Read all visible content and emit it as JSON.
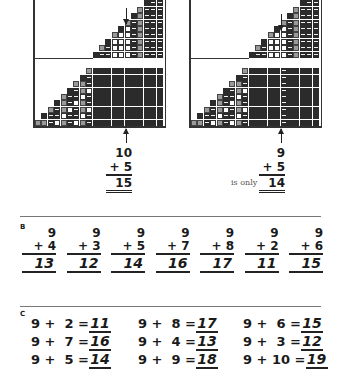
{
  "section_a": {
    "left_example": {
      "top": "10",
      "addend": "+ 5",
      "answer": "15"
    },
    "right_example": {
      "top": "9",
      "addend": "+ 5",
      "note": "is only",
      "answer": "14"
    }
  },
  "section_b": {
    "label": "B",
    "problems": [
      {
        "top": "9",
        "addend": "+ 4",
        "answer": "13"
      },
      {
        "top": "9",
        "addend": "+ 3",
        "answer": "12"
      },
      {
        "top": "9",
        "addend": "+ 5",
        "answer": "14"
      },
      {
        "top": "9",
        "addend": "+ 7",
        "answer": "16"
      },
      {
        "top": "9",
        "addend": "+ 8",
        "answer": "17"
      },
      {
        "top": "9",
        "addend": "+ 2",
        "answer": "11"
      },
      {
        "top": "9",
        "addend": "+ 6",
        "answer": "15"
      }
    ]
  },
  "section_c": {
    "label": "C",
    "rows": [
      [
        {
          "expr": "9 +  2 =",
          "answer": "11"
        },
        {
          "expr": "9 +  8 =",
          "answer": "17"
        },
        {
          "expr": "9 +  6 =",
          "answer": "15"
        }
      ],
      [
        {
          "expr": "9 +  7 =",
          "answer": "16"
        },
        {
          "expr": "9 +  4 =",
          "answer": "13"
        },
        {
          "expr": "9 +  3 =",
          "answer": "12"
        }
      ],
      [
        {
          "expr": "9 +  5 =",
          "answer": "14"
        },
        {
          "expr": "9 +  9 =",
          "answer": "18"
        },
        {
          "expr": "9 + 10 =",
          "answer": "19"
        }
      ]
    ]
  }
}
